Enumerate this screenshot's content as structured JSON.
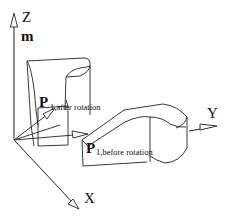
{
  "figure": {
    "axes": {
      "z_label": "Z",
      "x_label": "X",
      "y_label": "Y",
      "frame_label": "m"
    },
    "points": {
      "after": {
        "main": "P",
        "sub": "1,after rotation"
      },
      "before": {
        "main": "P",
        "sub": "1,before rotation"
      }
    }
  }
}
